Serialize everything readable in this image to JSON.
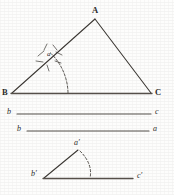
{
  "figure": {
    "ink_color": "#3a3632",
    "background_color": "#fdfdfc"
  },
  "triangle_upper": {
    "name": "triangle-ABC",
    "vertices": {
      "A": {
        "label": "A",
        "x": 95,
        "y": 18
      },
      "B": {
        "label": "B",
        "x": 10,
        "y": 93
      },
      "C": {
        "label": "C",
        "x": 152,
        "y": 93
      }
    },
    "angle_mark": {
      "label": "a",
      "at_vertex": "B",
      "arc_radius": 56,
      "tick_count": 6
    }
  },
  "segments": [
    {
      "name": "segment-b-c-top",
      "left_label": "B",
      "right_label": "C",
      "y": 93,
      "x1": 10,
      "x2": 152,
      "label_style": "capital"
    },
    {
      "name": "segment-b-c",
      "left_label": "b",
      "right_label": "c",
      "y": 114,
      "x1": 16,
      "x2": 152,
      "label_style": "lowercase"
    },
    {
      "name": "segment-b-a",
      "left_label": "b",
      "right_label": "a",
      "y": 131,
      "x1": 26,
      "x2": 150,
      "label_style": "lowercase"
    }
  ],
  "triangle_lower": {
    "name": "triangle-a-prime-b-prime-c-prime",
    "vertices": {
      "a_prime": {
        "label": "a′",
        "x": 77,
        "y": 149
      },
      "b_prime": {
        "label": "b′",
        "x": 36,
        "y": 178
      },
      "c_prime": {
        "label": "c′",
        "x": 135,
        "y": 178
      }
    },
    "dashed_arc": {
      "name": "dashed-construction-arc",
      "from_vertex": "a_prime",
      "to_baseline_x": 90
    }
  }
}
